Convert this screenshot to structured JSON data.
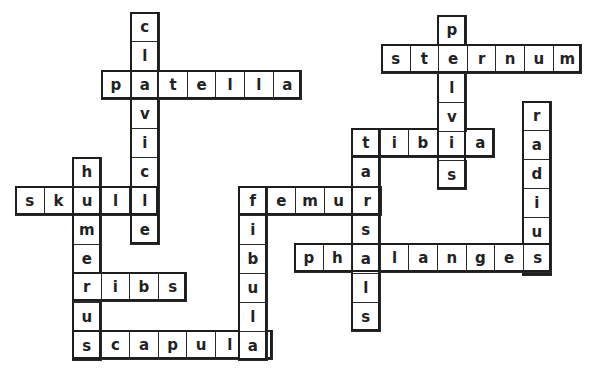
{
  "puzzle": {
    "title": "Bones crossword",
    "cell_w": 28.6,
    "cell_h": 29,
    "words": [
      {
        "word": "clavicle",
        "dir": "down",
        "x": 130,
        "y": 12
      },
      {
        "word": "patella",
        "dir": "across",
        "x": 101,
        "y": 70
      },
      {
        "word": "skull",
        "dir": "across",
        "x": 15,
        "y": 186
      },
      {
        "word": "humerus",
        "dir": "down",
        "x": 72,
        "y": 157
      },
      {
        "word": "ribs",
        "dir": "across",
        "x": 72,
        "y": 272
      },
      {
        "word": "scapula",
        "dir": "across",
        "x": 72,
        "y": 330
      },
      {
        "word": "fibula",
        "dir": "down",
        "x": 238,
        "y": 186
      },
      {
        "word": "femur",
        "dir": "across",
        "x": 238,
        "y": 186
      },
      {
        "word": "tarsals",
        "dir": "down",
        "x": 351,
        "y": 128
      },
      {
        "word": "tibia",
        "dir": "across",
        "x": 351,
        "y": 128
      },
      {
        "word": "pelvis",
        "dir": "down",
        "x": 437,
        "y": 15
      },
      {
        "word": "sternum",
        "dir": "across",
        "x": 381,
        "y": 44
      },
      {
        "word": "radius",
        "dir": "down",
        "x": 522,
        "y": 101
      },
      {
        "word": "phalanges",
        "dir": "across",
        "x": 294,
        "y": 243
      }
    ]
  }
}
